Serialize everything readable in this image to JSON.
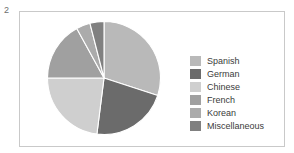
{
  "figure": {
    "number_label": "2",
    "frame_color": "#c9c9c9",
    "background_color": "#ffffff"
  },
  "legend": {
    "position": "right",
    "items": [
      {
        "label": "Spanish",
        "color": "#b9b9b9"
      },
      {
        "label": "German",
        "color": "#6b6b6b"
      },
      {
        "label": "Chinese",
        "color": "#cfcfcf"
      },
      {
        "label": "French",
        "color": "#a0a0a0"
      },
      {
        "label": "Korean",
        "color": "#ababab"
      },
      {
        "label": "Miscellaneous",
        "color": "#808080"
      }
    ]
  },
  "chart_data": {
    "type": "pie",
    "title": "",
    "subtitle": "",
    "xlabel": "",
    "ylabel": "",
    "grid": false,
    "legend_position": "right",
    "start_angle_deg": 0,
    "direction": "clockwise",
    "categories": [
      "Spanish",
      "German",
      "Chinese",
      "French",
      "Korean",
      "Miscellaneous"
    ],
    "values": [
      30,
      22,
      23,
      17,
      4,
      4
    ],
    "unit": "percent",
    "slices": [
      {
        "label": "Spanish",
        "value": 30,
        "color": "#b9b9b9",
        "start_deg": 0,
        "end_deg": 108
      },
      {
        "label": "German",
        "value": 22,
        "color": "#6b6b6b",
        "start_deg": 108,
        "end_deg": 187.2
      },
      {
        "label": "Chinese",
        "value": 23,
        "color": "#cfcfcf",
        "start_deg": 187.2,
        "end_deg": 270
      },
      {
        "label": "French",
        "value": 17,
        "color": "#a0a0a0",
        "start_deg": 270,
        "end_deg": 331.2
      },
      {
        "label": "Korean",
        "value": 4,
        "color": "#ababab",
        "start_deg": 331.2,
        "end_deg": 345.6
      },
      {
        "label": "Miscellaneous",
        "value": 4,
        "color": "#808080",
        "start_deg": 345.6,
        "end_deg": 360
      }
    ],
    "separator_color": "#ffffff"
  }
}
